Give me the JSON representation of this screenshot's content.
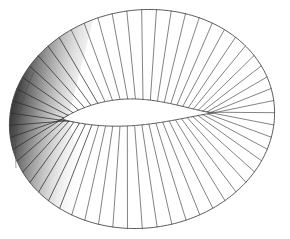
{
  "figure": {
    "type": "line-art",
    "background_color": "#ffffff",
    "canvas": {
      "width": 290,
      "height": 239
    },
    "stroke_color": "#595959",
    "stroke_color_dark": "#2b2b2b",
    "outline_color": "#4a4a4a",
    "stroke_width": 0.75,
    "outline_width": 0.9,
    "shading": {
      "present": true,
      "side": "left",
      "gradient_from": "#1f1f1f",
      "gradient_mid": "#8a8a8a",
      "gradient_to": "#ffffff",
      "opacity": 0.85
    },
    "generator_count": 56,
    "outer_curve": {
      "name": "outer-ellipse",
      "center_x": 142,
      "center_y": 119,
      "radius_x": 133,
      "radius_y": 109,
      "rotation_deg": -8
    },
    "inner_curve": {
      "name": "inner-lens",
      "left_x": 63,
      "right_x": 213,
      "center_y": 119,
      "upper_bulge": 22,
      "lower_bulge": 12,
      "pinch_point_x": 213,
      "pinch_point_y": 120
    },
    "silhouette": {
      "name": "left-fold-band",
      "top_x": 34,
      "top_y": 72,
      "bottom_x": 16,
      "bottom_y": 168
    },
    "bounds": {
      "top": 11,
      "bottom": 229,
      "left": 8,
      "right": 276
    }
  },
  "chart_data": {
    "type": "line",
    "xlabel": "",
    "ylabel": "",
    "grid": false,
    "legend": "none",
    "xlim": [
      0,
      290
    ],
    "ylim": [
      0,
      239
    ],
    "series": [
      {
        "name": "outer-boundary-ellipse",
        "description": "Closed outer ellipse boundary of the band",
        "center": [
          142,
          119
        ],
        "radii": [
          133,
          109
        ],
        "rotation_deg": -8
      },
      {
        "name": "inner-boundary-lens",
        "description": "Inner eye/lens shaped hole pinching to a cusp at right",
        "endpoints": [
          [
            63,
            113
          ],
          [
            213,
            120
          ]
        ],
        "upper_bulge_px": 22,
        "lower_bulge_px": 12
      },
      {
        "name": "generators",
        "description": "Straight ruling lines from inner curve to outer ellipse",
        "count": 56,
        "parameter_range_deg": [
          0,
          360
        ]
      }
    ]
  }
}
